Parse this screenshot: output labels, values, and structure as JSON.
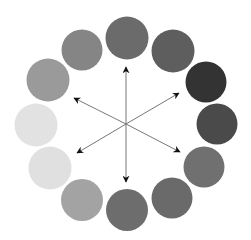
{
  "diagram": {
    "type": "color-wheel-grayscale",
    "background": "#ffffff",
    "center": [
      126,
      124
    ],
    "circles": [
      {
        "cx": 127,
        "cy": 38,
        "r": 21.5,
        "fill": "#6b6b6b"
      },
      {
        "cx": 173,
        "cy": 51,
        "r": 21.5,
        "fill": "#5e5e5e"
      },
      {
        "cx": 206,
        "cy": 82,
        "r": 20.5,
        "fill": "#333333"
      },
      {
        "cx": 217,
        "cy": 124,
        "r": 20.5,
        "fill": "#4a4a4a"
      },
      {
        "cx": 204,
        "cy": 167,
        "r": 20.5,
        "fill": "#707070"
      },
      {
        "cx": 172,
        "cy": 198,
        "r": 20.5,
        "fill": "#6a6a6a"
      },
      {
        "cx": 127,
        "cy": 210,
        "r": 21,
        "fill": "#6d6d6d"
      },
      {
        "cx": 82,
        "cy": 200,
        "r": 21,
        "fill": "#a3a3a3"
      },
      {
        "cx": 50,
        "cy": 168,
        "r": 21.5,
        "fill": "#e0e0e0"
      },
      {
        "cx": 36,
        "cy": 125,
        "r": 21.5,
        "fill": "#e2e2e2"
      },
      {
        "cx": 48,
        "cy": 80,
        "r": 21.5,
        "fill": "#9a9a9a"
      },
      {
        "cx": 82,
        "cy": 50,
        "r": 20.5,
        "fill": "#858585"
      }
    ],
    "arrows": [
      {
        "name": "up",
        "x": 126,
        "y": 67
      },
      {
        "name": "upper-right",
        "x": 179,
        "y": 93
      },
      {
        "name": "lower-right",
        "x": 180,
        "y": 152
      },
      {
        "name": "down",
        "x": 126,
        "y": 182
      },
      {
        "name": "lower-left",
        "x": 77,
        "y": 153
      },
      {
        "name": "upper-left",
        "x": 74,
        "y": 98
      }
    ],
    "arrow_color": "#777777",
    "arrowhead_color": "#111111"
  }
}
